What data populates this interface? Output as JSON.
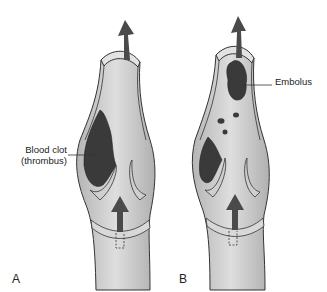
{
  "figure": {
    "panels": [
      {
        "id": "A",
        "letter": "A",
        "description": "Vein with blood clot (thrombus) attached to wall above valve"
      },
      {
        "id": "B",
        "letter": "B",
        "description": "Vein with clot fragment (embolus) breaking off and traveling upward"
      }
    ],
    "labels": {
      "thrombus_line1": "Blood clot",
      "thrombus_line2": "(thrombus)",
      "embolus": "Embolus"
    },
    "colors": {
      "vessel_fill": "#c8c8c8",
      "vessel_wall": "#dcdcdc",
      "outline": "#333333",
      "clot": "#3a3a3a",
      "arrow": "#4a4a4a",
      "background": "#ffffff"
    }
  }
}
